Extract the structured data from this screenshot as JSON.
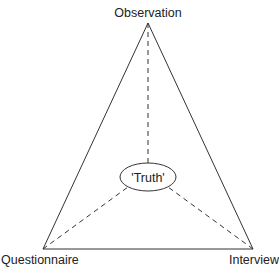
{
  "diagram": {
    "type": "triangulation",
    "nodes": {
      "top": "Observation",
      "bottom_left": "Questionnaire",
      "bottom_right": "Interview",
      "center": "'Truth'"
    },
    "edges": [
      {
        "from": "Observation",
        "to": "Questionnaire",
        "style": "solid"
      },
      {
        "from": "Observation",
        "to": "Interview",
        "style": "solid"
      },
      {
        "from": "Questionnaire",
        "to": "Interview",
        "style": "solid"
      },
      {
        "from": "Observation",
        "to": "'Truth'",
        "style": "dashed"
      },
      {
        "from": "Questionnaire",
        "to": "'Truth'",
        "style": "dashed"
      },
      {
        "from": "Interview",
        "to": "'Truth'",
        "style": "dashed"
      }
    ],
    "line_color": "#333333"
  }
}
